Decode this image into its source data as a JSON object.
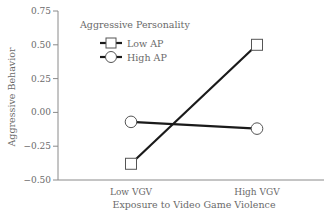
{
  "chart_data": {
    "type": "line",
    "title": "",
    "xlabel": "Exposure to Video Game Violence",
    "ylabel": "Aggressive Behavior",
    "categories": [
      "Low VGV",
      "High VGV"
    ],
    "series": [
      {
        "name": "Low AP",
        "marker": "square",
        "values": [
          -0.38,
          0.5
        ]
      },
      {
        "name": "High AP",
        "marker": "circle",
        "values": [
          -0.07,
          -0.12
        ]
      }
    ],
    "ylim": [
      -0.5,
      0.75
    ],
    "yticks": [
      0.75,
      0.5,
      0.25,
      0.0,
      -0.25,
      -0.5
    ],
    "ytick_labels": [
      "0.75",
      "0.50",
      "0.25",
      "0.00",
      "−0.25",
      "−0.50"
    ],
    "legend": {
      "title": "Aggressive Personality",
      "position": "upper-left-inside",
      "entries": [
        "Low AP",
        "High AP"
      ]
    },
    "grid": false
  },
  "colors": {
    "line": "#1a1a1a",
    "axis": "#8a8a8a",
    "text": "#6a6a6a",
    "marker_fill": "#ffffff",
    "marker_stroke": "#555555"
  }
}
